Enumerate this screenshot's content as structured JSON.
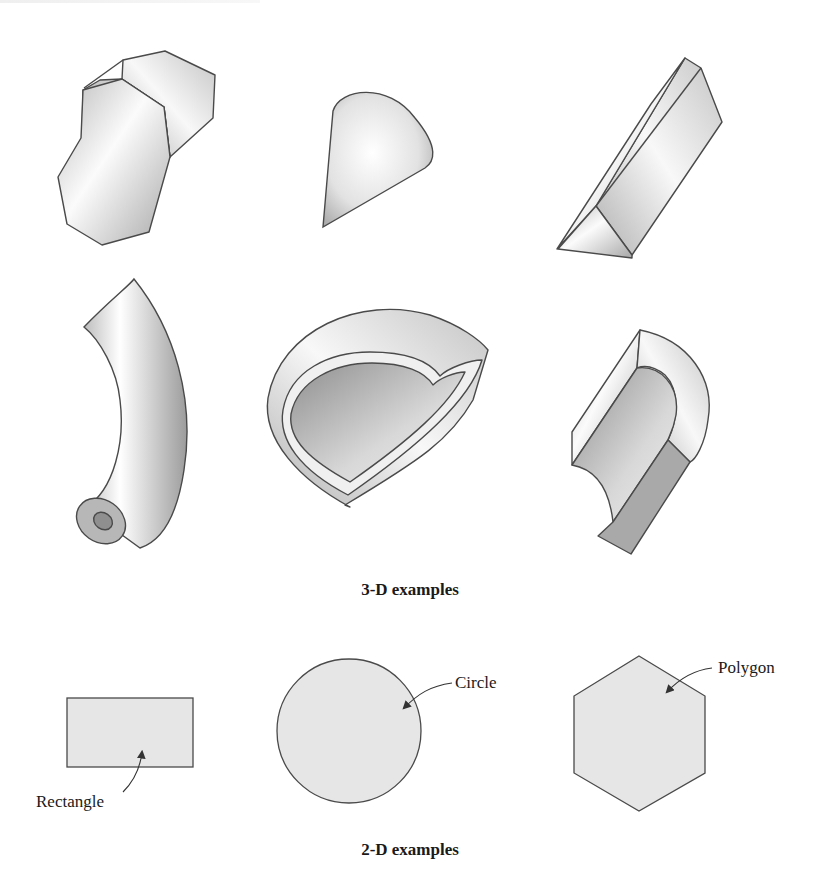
{
  "figure": {
    "sections": [
      {
        "id": "3d",
        "caption": "3-D examples",
        "shapes": [
          {
            "name": "octagonal-prism"
          },
          {
            "name": "cone-segment"
          },
          {
            "name": "triangular-prism"
          },
          {
            "name": "curved-tube"
          },
          {
            "name": "hollow-shell-segment"
          },
          {
            "name": "channel-section"
          }
        ]
      },
      {
        "id": "2d",
        "caption": "2-D examples",
        "shapes": [
          {
            "name": "rectangle",
            "label": "Rectangle"
          },
          {
            "name": "circle",
            "label": "Circle"
          },
          {
            "name": "polygon",
            "label": "Polygon"
          }
        ]
      }
    ],
    "colors": {
      "outline": "#4a4a4a",
      "fill_2d": "#e6e6e6",
      "shade_light": "#fafafa",
      "shade_dark": "#9a9a9a"
    }
  }
}
